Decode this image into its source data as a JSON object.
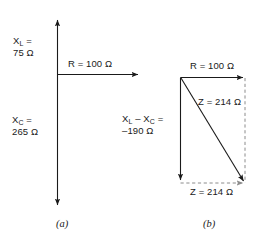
{
  "figure": {
    "stroke_color": "#1a1a1a",
    "background_color": "#ffffff",
    "dashed_color": "#8c8c8c"
  },
  "diagram_a": {
    "caption": "(a)",
    "reactance_inductive_label": "X",
    "reactance_inductive_sub": "L",
    "reactance_inductive_eq": " =",
    "reactance_inductive_value": "75 Ω",
    "reactance_capacitive_label": "X",
    "reactance_capacitive_sub": "C",
    "reactance_capacitive_eq": " =",
    "reactance_capacitive_value": "265 Ω",
    "resistance_label": "R = 100 Ω",
    "vectors": [
      {
        "name": "X_L",
        "direction": "up",
        "magnitude": 75,
        "unit": "Ω",
        "style": "solid-arrow"
      },
      {
        "name": "X_C",
        "direction": "down",
        "magnitude": 265,
        "unit": "Ω",
        "style": "solid-arrow"
      },
      {
        "name": "R",
        "direction": "right",
        "magnitude": 100,
        "unit": "Ω",
        "style": "solid-arrow"
      }
    ]
  },
  "diagram_b": {
    "caption": "(b)",
    "resistance_label": "R = 100 Ω",
    "impedance_diagonal_label": "Z = 214 Ω",
    "impedance_bottom_label": "Z = 214 Ω",
    "net_reactance_line1_pre": "X",
    "net_reactance_line1_sub1": "L",
    "net_reactance_line1_mid": " – X",
    "net_reactance_line1_sub2": "C",
    "net_reactance_line1_post": " =",
    "net_reactance_line2": "–190 Ω",
    "vectors": [
      {
        "name": "R",
        "direction": "right",
        "magnitude": 100,
        "unit": "Ω",
        "style": "solid-arrow"
      },
      {
        "name": "X_L - X_C",
        "direction": "down",
        "magnitude": -190,
        "unit": "Ω",
        "style": "solid-arrow"
      },
      {
        "name": "Z",
        "direction": "diagonal",
        "magnitude": 214,
        "unit": "Ω",
        "style": "solid-arrow"
      },
      {
        "name": "R-ghost",
        "direction": "right",
        "magnitude": 100,
        "unit": "Ω",
        "style": "dashed-arrow"
      },
      {
        "name": "X-ghost",
        "direction": "down",
        "magnitude": -190,
        "unit": "Ω",
        "style": "dashed"
      }
    ]
  }
}
